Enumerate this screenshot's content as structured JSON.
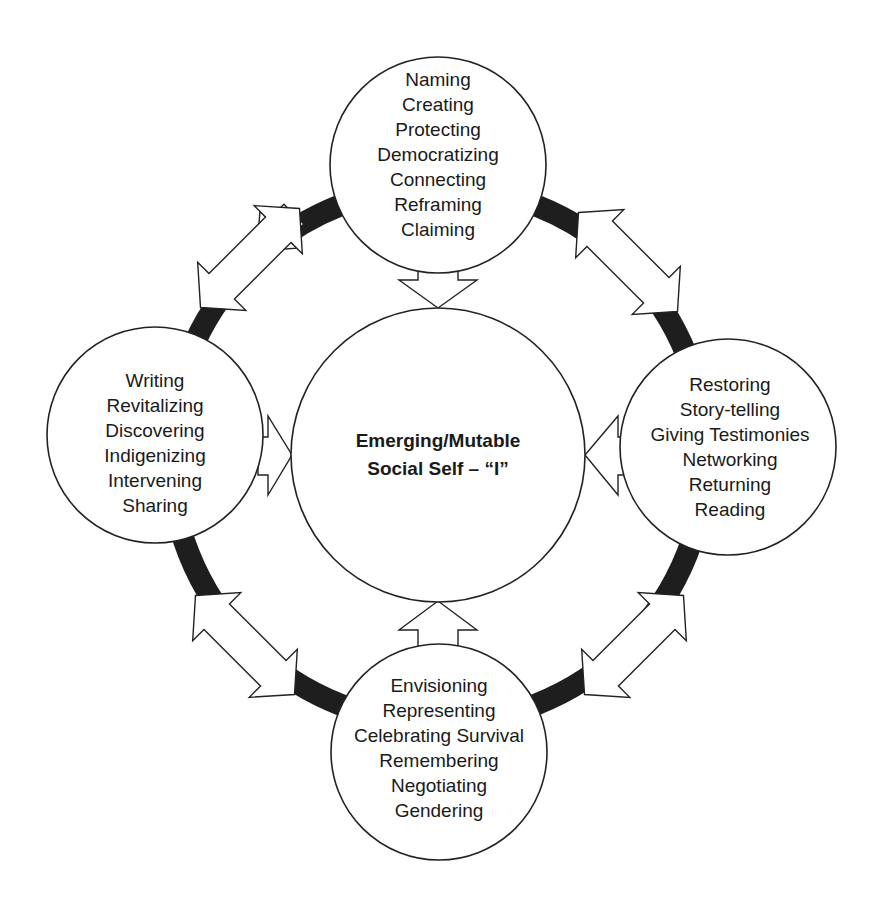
{
  "diagram": {
    "type": "cycle-hub-diagram",
    "colors": {
      "ring": "#1e1e1e",
      "stroke": "#222222",
      "fill": "#ffffff",
      "text": "#1a1a1a"
    },
    "center": {
      "line1": "Emerging/Mutable",
      "line2": "Social Self – “I”"
    },
    "nodes": {
      "top": {
        "items": [
          "Naming",
          "Creating",
          "Protecting",
          "Democratizing",
          "Connecting",
          "Reframing",
          "Claiming"
        ]
      },
      "left": {
        "items": [
          "Writing",
          "Revitalizing",
          "Discovering",
          "Indigenizing",
          "Intervening",
          "Sharing"
        ]
      },
      "right": {
        "items": [
          "Restoring",
          "Story-telling",
          "Giving Testimonies",
          "Networking",
          "Returning",
          "Reading"
        ]
      },
      "bottom": {
        "items": [
          "Envisioning",
          "Representing",
          "Celebrating Survival",
          "Remembering",
          "Negotiating",
          "Gendering"
        ]
      }
    },
    "connectors": {
      "inward_arrows": [
        "top-to-center",
        "left-to-center",
        "right-to-center",
        "bottom-to-center"
      ],
      "double_arrows": [
        "top-left",
        "top-right",
        "bottom-left",
        "bottom-right"
      ]
    }
  }
}
